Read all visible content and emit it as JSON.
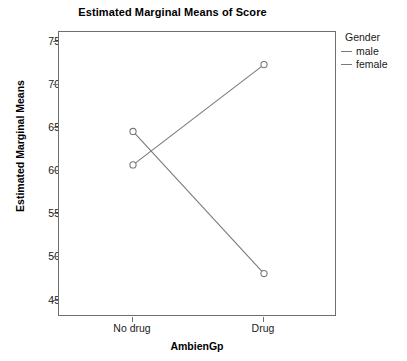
{
  "chart_data": {
    "type": "line",
    "title": "Estimated Marginal Means of Score",
    "xlabel": "AmbienGp",
    "ylabel": "Estimated Marginal Means",
    "categories": [
      "No drug",
      "Drug"
    ],
    "series": [
      {
        "name": "male",
        "values": [
          61,
          73
        ],
        "color": "#7a7a7a"
      },
      {
        "name": "female",
        "values": [
          65,
          48
        ],
        "color": "#7a7a7a"
      }
    ],
    "ylim": [
      42.8,
      76.9
    ],
    "yticks": [
      45,
      50,
      55,
      60,
      65,
      70,
      75
    ],
    "ytick_labels": [
      "45",
      "50",
      "55",
      "60",
      "65",
      "70",
      "75"
    ],
    "grid": false,
    "legend_title": "Gender",
    "legend_position": "right",
    "marker": "open-circle",
    "frame": true
  },
  "legend": {
    "title": "Gender",
    "items": [
      {
        "label": "male"
      },
      {
        "label": "female"
      }
    ]
  },
  "axes": {
    "x_title": "AmbienGp",
    "y_title": "Estimated Marginal Means",
    "x_tick_labels": [
      "No drug",
      "Drug"
    ],
    "y_tick_labels": [
      "75",
      "70",
      "65",
      "60",
      "55",
      "50",
      "45"
    ]
  },
  "colors": {
    "line": "#7a7a7a",
    "frame": "#6e6e6e",
    "text": "#1a1a1a",
    "background": "#ffffff"
  }
}
